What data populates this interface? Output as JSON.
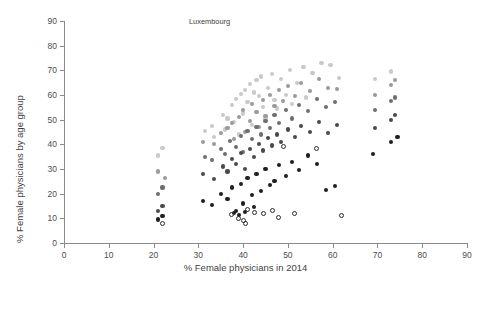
{
  "chart_data": {
    "type": "scatter",
    "title": "",
    "xlabel": "% Female physicians in 2014",
    "ylabel": "% Female physicians by age group",
    "xlim": [
      0,
      90
    ],
    "ylim": [
      0,
      90
    ],
    "xticks": [
      0,
      10,
      20,
      30,
      40,
      50,
      60,
      70,
      80,
      90
    ],
    "yticks": [
      0,
      10,
      20,
      30,
      40,
      50,
      60,
      70,
      80,
      90
    ],
    "grid": false,
    "legend_position": "bottom",
    "series": [
      {
        "name": "% of total physicians under 35 years old",
        "color": "#c9c9c9",
        "marker": "filled-circle",
        "points": [
          [
            21.0,
            35.5
          ],
          [
            22.0,
            38.5
          ],
          [
            31.5,
            45.5
          ],
          [
            33.0,
            47.5
          ],
          [
            35.5,
            52.0
          ],
          [
            36.5,
            50.5
          ],
          [
            37.5,
            56.0
          ],
          [
            38.5,
            58.5
          ],
          [
            39.5,
            60.5
          ],
          [
            40.5,
            62.0
          ],
          [
            41.0,
            57.0
          ],
          [
            41.5,
            64.5
          ],
          [
            42.5,
            61.0
          ],
          [
            43.0,
            66.0
          ],
          [
            43.5,
            59.5
          ],
          [
            44.0,
            67.5
          ],
          [
            44.5,
            55.0
          ],
          [
            45.5,
            63.0
          ],
          [
            46.5,
            68.5
          ],
          [
            47.0,
            58.0
          ],
          [
            48.5,
            66.5
          ],
          [
            49.5,
            60.0
          ],
          [
            50.5,
            70.0
          ],
          [
            52.0,
            65.0
          ],
          [
            53.5,
            71.5
          ],
          [
            55.5,
            69.0
          ],
          [
            57.5,
            73.0
          ],
          [
            59.5,
            72.0
          ],
          [
            61.5,
            67.0
          ],
          [
            69.5,
            66.5
          ],
          [
            73.0,
            69.5
          ],
          [
            33.5,
            43.0
          ],
          [
            36.0,
            46.0
          ],
          [
            38.0,
            49.0
          ],
          [
            39.0,
            44.0
          ],
          [
            40.0,
            52.5
          ],
          [
            42.0,
            48.0
          ],
          [
            45.0,
            50.5
          ],
          [
            47.5,
            54.5
          ],
          [
            51.0,
            56.5
          ],
          [
            54.0,
            59.0
          ]
        ]
      },
      {
        "name": "% of total physicians aged 35–44 years old",
        "color": "#9a9a9a",
        "marker": "filled-circle",
        "points": [
          [
            21.0,
            29.0
          ],
          [
            22.5,
            26.5
          ],
          [
            31.0,
            41.0
          ],
          [
            33.5,
            40.0
          ],
          [
            35.0,
            44.5
          ],
          [
            36.5,
            46.5
          ],
          [
            37.5,
            48.5
          ],
          [
            38.0,
            42.0
          ],
          [
            39.0,
            51.0
          ],
          [
            40.0,
            54.0
          ],
          [
            40.5,
            45.0
          ],
          [
            41.5,
            49.5
          ],
          [
            42.0,
            56.5
          ],
          [
            43.0,
            53.0
          ],
          [
            43.5,
            47.0
          ],
          [
            44.5,
            58.0
          ],
          [
            45.0,
            51.5
          ],
          [
            46.0,
            60.0
          ],
          [
            47.0,
            55.5
          ],
          [
            48.0,
            62.0
          ],
          [
            49.0,
            57.5
          ],
          [
            50.0,
            63.5
          ],
          [
            51.5,
            59.5
          ],
          [
            53.0,
            65.0
          ],
          [
            55.0,
            61.5
          ],
          [
            57.0,
            66.5
          ],
          [
            59.0,
            63.0
          ],
          [
            61.0,
            62.5
          ],
          [
            69.5,
            60.0
          ],
          [
            73.0,
            64.0
          ],
          [
            74.0,
            66.0
          ]
        ]
      },
      {
        "name": "% of total physicians aged 45–54 years old",
        "color": "#6e6e6e",
        "marker": "filled-circle",
        "points": [
          [
            21.0,
            20.0
          ],
          [
            22.0,
            22.5
          ],
          [
            31.5,
            35.0
          ],
          [
            33.0,
            33.5
          ],
          [
            35.0,
            38.0
          ],
          [
            36.0,
            36.0
          ],
          [
            37.0,
            41.5
          ],
          [
            38.5,
            39.0
          ],
          [
            39.5,
            43.5
          ],
          [
            40.0,
            37.0
          ],
          [
            41.0,
            45.5
          ],
          [
            42.0,
            42.0
          ],
          [
            43.0,
            47.0
          ],
          [
            44.0,
            44.0
          ],
          [
            45.0,
            49.5
          ],
          [
            46.0,
            46.5
          ],
          [
            47.0,
            52.0
          ],
          [
            48.0,
            48.5
          ],
          [
            49.5,
            54.0
          ],
          [
            51.0,
            50.5
          ],
          [
            52.5,
            56.0
          ],
          [
            54.5,
            53.5
          ],
          [
            56.5,
            58.5
          ],
          [
            58.5,
            55.0
          ],
          [
            60.5,
            57.0
          ],
          [
            69.5,
            54.0
          ],
          [
            73.0,
            57.5
          ],
          [
            74.0,
            59.0
          ]
        ]
      },
      {
        "name": "% of total physicians aged 55–64 years old",
        "color": "#4a4a4a",
        "marker": "filled-circle",
        "points": [
          [
            21.0,
            13.0
          ],
          [
            22.0,
            15.0
          ],
          [
            31.0,
            28.0
          ],
          [
            33.5,
            26.0
          ],
          [
            35.5,
            31.0
          ],
          [
            36.5,
            29.0
          ],
          [
            37.5,
            34.0
          ],
          [
            38.5,
            32.0
          ],
          [
            39.5,
            36.5
          ],
          [
            40.5,
            30.0
          ],
          [
            41.5,
            38.0
          ],
          [
            42.5,
            35.0
          ],
          [
            43.5,
            40.0
          ],
          [
            44.5,
            37.5
          ],
          [
            45.5,
            42.5
          ],
          [
            46.5,
            39.5
          ],
          [
            47.5,
            44.0
          ],
          [
            48.5,
            41.0
          ],
          [
            50.0,
            46.0
          ],
          [
            51.5,
            43.0
          ],
          [
            53.0,
            47.5
          ],
          [
            55.0,
            45.0
          ],
          [
            57.0,
            49.0
          ],
          [
            59.0,
            44.5
          ],
          [
            61.0,
            48.0
          ],
          [
            69.5,
            46.5
          ],
          [
            73.0,
            50.0
          ],
          [
            74.0,
            52.0
          ]
        ]
      },
      {
        "name": "% of total physicians aged 65–74 years old",
        "color": "#1f1f1f",
        "marker": "filled-circle",
        "points": [
          [
            21.0,
            9.5
          ],
          [
            22.0,
            11.0
          ],
          [
            31.0,
            17.0
          ],
          [
            33.0,
            15.5
          ],
          [
            35.0,
            20.0
          ],
          [
            36.5,
            18.0
          ],
          [
            37.5,
            22.5
          ],
          [
            38.5,
            13.0
          ],
          [
            39.5,
            24.0
          ],
          [
            40.0,
            16.0
          ],
          [
            41.0,
            26.5
          ],
          [
            42.0,
            19.5
          ],
          [
            43.0,
            28.0
          ],
          [
            44.0,
            21.0
          ],
          [
            45.0,
            30.0
          ],
          [
            46.0,
            23.5
          ],
          [
            47.0,
            25.0
          ],
          [
            48.0,
            31.5
          ],
          [
            49.5,
            27.0
          ],
          [
            51.0,
            33.0
          ],
          [
            52.5,
            29.5
          ],
          [
            54.5,
            35.5
          ],
          [
            56.5,
            32.0
          ],
          [
            58.5,
            21.5
          ],
          [
            60.5,
            23.0
          ],
          [
            69.0,
            36.0
          ],
          [
            73.0,
            41.0
          ],
          [
            74.5,
            43.0
          ],
          [
            38.0,
            12.0
          ],
          [
            39.0,
            11.5
          ],
          [
            40.5,
            12.5
          ],
          [
            42.5,
            14.5
          ]
        ]
      },
      {
        "name": "% of total physicians aged 75 years old and over",
        "color": "#2b2b2b",
        "marker": "open-circle",
        "points": [
          [
            22.0,
            8.0
          ],
          [
            37.5,
            11.5
          ],
          [
            39.0,
            10.0
          ],
          [
            40.0,
            9.0
          ],
          [
            40.5,
            8.0
          ],
          [
            41.0,
            13.5
          ],
          [
            42.5,
            12.5
          ],
          [
            44.5,
            12.0
          ],
          [
            46.5,
            13.0
          ],
          [
            48.0,
            10.5
          ],
          [
            51.5,
            12.0
          ],
          [
            56.5,
            38.5
          ],
          [
            62.0,
            11.0
          ],
          [
            49.0,
            39.0
          ]
        ]
      }
    ],
    "annotations": [
      {
        "label": "Luxembourg",
        "lx": 189,
        "ly": 18,
        "px": 215,
        "py": 74
      },
      {
        "label": "United Kingdom",
        "lx": 246,
        "ly": 18,
        "px": 265,
        "py": 60
      },
      {
        "label": "Belgium",
        "lx": 212,
        "ly": 26,
        "px": 233,
        "py": 66
      },
      {
        "label": "Netherlands",
        "lx": 287,
        "ly": 27,
        "px": 299,
        "py": 62
      },
      {
        "label": "Iceland",
        "lx": 198,
        "ly": 35,
        "px": 220,
        "py": 73
      },
      {
        "label": "New Zealand",
        "lx": 229,
        "ly": 35,
        "px": 247,
        "py": 68
      },
      {
        "label": "Norway",
        "lx": 262,
        "ly": 39,
        "px": 276,
        "py": 70
      },
      {
        "label": "Slovak",
        "lx": 318,
        "ly": 36,
        "px": 330,
        "py": 66
      },
      {
        "label": "Switzerland",
        "lx": 206,
        "ly": 43,
        "px": 232,
        "py": 78
      },
      {
        "label": "Denmark",
        "lx": 271,
        "ly": 44,
        "px": 286,
        "py": 72
      },
      {
        "label": "Slovenia",
        "lx": 341,
        "ly": 42,
        "px": 348,
        "py": 68
      },
      {
        "label": "France",
        "lx": 241,
        "ly": 51,
        "px": 257,
        "py": 78
      },
      {
        "label": "Czech Republic",
        "lx": 290,
        "ly": 49,
        "px": 312,
        "py": 72
      },
      {
        "label": "Estonia",
        "lx": 390,
        "ly": 20,
        "px": 396,
        "py": 60
      },
      {
        "label": "Italy",
        "lx": 230,
        "ly": 57,
        "px": 247,
        "py": 82
      },
      {
        "label": "Sweden",
        "lx": 259,
        "ly": 53,
        "px": 272,
        "py": 80
      },
      {
        "label": "Spain",
        "lx": 296,
        "ly": 54,
        "px": 305,
        "py": 76
      },
      {
        "label": "Finland",
        "lx": 330,
        "ly": 56,
        "px": 338,
        "py": 78
      },
      {
        "label": "Lithuania",
        "lx": 360,
        "ly": 38,
        "px": 374,
        "py": 80
      },
      {
        "label": "Latvia",
        "lx": 408,
        "ly": 38,
        "px": 398,
        "py": 62
      },
      {
        "label": "Germany",
        "lx": 249,
        "ly": 61,
        "px": 262,
        "py": 84
      },
      {
        "label": "Hungary",
        "lx": 303,
        "ly": 62,
        "px": 315,
        "py": 84
      },
      {
        "label": "Ireland",
        "lx": 236,
        "ly": 66,
        "px": 251,
        "py": 88
      },
      {
        "label": "Austria",
        "lx": 263,
        "ly": 70,
        "px": 272,
        "py": 88
      },
      {
        "label": "Australia",
        "lx": 200,
        "ly": 83,
        "px": 225,
        "py": 96
      },
      {
        "label": "Canada",
        "lx": 238,
        "ly": 86,
        "px": 259,
        "py": 98
      },
      {
        "label": "Chile",
        "lx": 211,
        "ly": 92,
        "px": 237,
        "py": 104
      },
      {
        "label": "United States",
        "lx": 183,
        "ly": 105,
        "px": 206,
        "py": 130
      },
      {
        "label": "Israel",
        "lx": 246,
        "ly": 106,
        "px": 252,
        "py": 126
      },
      {
        "label": "Korea",
        "lx": 116,
        "ly": 132,
        "px": 129,
        "py": 157
      },
      {
        "label": "Japan",
        "lx": 100,
        "ly": 152,
        "px": 122,
        "py": 167
      }
    ]
  },
  "axes": {
    "y_title": "% Female physicians by age group",
    "x_title": "% Female physicians in 2014",
    "x_tick_labels": [
      "0",
      "10",
      "20",
      "30",
      "40",
      "50",
      "60",
      "70",
      "80",
      "90"
    ],
    "y_tick_labels": [
      "0",
      "10",
      "20",
      "30",
      "40",
      "50",
      "60",
      "70",
      "80",
      "90"
    ]
  },
  "legend": {
    "items": [
      {
        "label": "% of total physicians under 35 years old",
        "color": "#c9c9c9",
        "marker": "filled-circle"
      },
      {
        "label": "% of total physicians aged 35–44 years old",
        "color": "#9a9a9a",
        "marker": "filled-circle"
      },
      {
        "label": "% of total physicians aged 45–54 years old",
        "color": "#6e6e6e",
        "marker": "filled-circle"
      },
      {
        "label": "% of total physicians aged 55–64 years old",
        "color": "#4a4a4a",
        "marker": "filled-circle"
      },
      {
        "label": "% of total physicians aged 65–74 years old",
        "color": "#1f1f1f",
        "marker": "filled-circle"
      },
      {
        "label": "% of total physicians aged 75 years old and over",
        "color": "#2b2b2b",
        "marker": "open-circle"
      }
    ]
  }
}
